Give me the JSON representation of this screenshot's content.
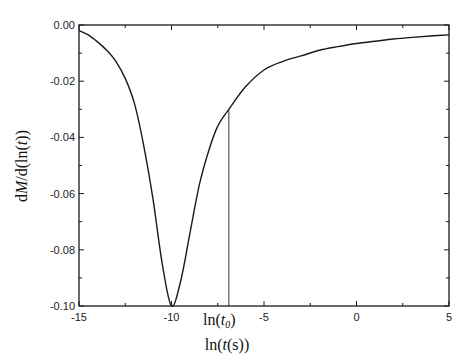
{
  "chart_data": {
    "type": "line",
    "title": "",
    "xlabel": "ln(t(s))",
    "ylabel": "dM/d(ln(t))",
    "xlim": [
      -15,
      5
    ],
    "ylim": [
      -0.1,
      0.0
    ],
    "grid": false,
    "legend": null,
    "x_ticks": [
      -15,
      -10,
      -5,
      0,
      5
    ],
    "x_tick_labels": [
      "-15",
      "-10",
      "-5",
      "0",
      "5"
    ],
    "y_ticks": [
      0.0,
      -0.02,
      -0.04,
      -0.06,
      -0.08,
      -0.1
    ],
    "y_tick_labels": [
      "0.00",
      "-0.02",
      "-0.04",
      "-0.06",
      "-0.08",
      "-0.10"
    ],
    "series": [
      {
        "name": "dM/d(ln(t))",
        "x": [
          -15,
          -14.5,
          -14,
          -13.5,
          -13,
          -12.5,
          -12,
          -11.5,
          -11,
          -10.5,
          -10,
          -9.5,
          -9,
          -8.5,
          -8,
          -7.5,
          -6.9,
          -6,
          -5,
          -4,
          -3,
          -2,
          -1,
          0,
          1,
          2,
          3,
          4,
          5
        ],
        "y": [
          -0.002,
          -0.0035,
          -0.006,
          -0.009,
          -0.013,
          -0.019,
          -0.028,
          -0.043,
          -0.062,
          -0.085,
          -0.1,
          -0.091,
          -0.074,
          -0.057,
          -0.045,
          -0.036,
          -0.03,
          -0.022,
          -0.016,
          -0.013,
          -0.011,
          -0.009,
          -0.0077,
          -0.0066,
          -0.0058,
          -0.005,
          -0.0044,
          -0.0039,
          -0.0035
        ]
      }
    ],
    "annotations": [
      {
        "type": "vline",
        "x": -6.9,
        "y_from": -0.1,
        "y_to": -0.03,
        "label": "ln(t0)"
      }
    ]
  },
  "labels": {
    "xlabel_prefix": "ln(",
    "xlabel_t": "t",
    "xlabel_suffix": "(s))",
    "ylabel_prefix": "d",
    "ylabel_M": "M",
    "ylabel_mid": "/d(ln(",
    "ylabel_t": "t",
    "ylabel_suffix": "))",
    "t0_prefix": "ln(",
    "t0_t": "t",
    "t0_sub": "0",
    "t0_suffix": ")"
  }
}
